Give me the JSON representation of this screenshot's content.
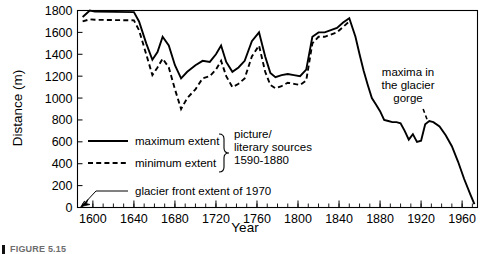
{
  "figure": {
    "caption_marker": "▌",
    "caption_text": "FIGURE 5.15"
  },
  "chart_data": {
    "type": "line",
    "title": "",
    "xlabel": "Year",
    "ylabel": "Distance (m)",
    "xlim": [
      1585,
      1975
    ],
    "ylim": [
      0,
      1800
    ],
    "grid": false,
    "legend_position": "inside-lower-left",
    "x_major_ticks": [
      1600,
      1640,
      1680,
      1720,
      1760,
      1800,
      1840,
      1880,
      1920,
      1960
    ],
    "x_tick_labels": [
      "1600",
      "1640",
      "1680",
      "1720",
      "1760",
      "1800",
      "1840",
      "1880",
      "1920",
      "1960"
    ],
    "x_minor_tick_step": 10,
    "y_major_ticks": [
      0,
      200,
      400,
      600,
      800,
      1000,
      1200,
      1400,
      1600,
      1800
    ],
    "y_tick_labels": [
      "0",
      "200",
      "400",
      "600",
      "800",
      "1000",
      "1200",
      "1400",
      "1600",
      "1800"
    ],
    "series": [
      {
        "name": "maximum extent",
        "style": "solid",
        "x": [
          1590,
          1597,
          1602,
          1640,
          1645,
          1652,
          1658,
          1663,
          1668,
          1674,
          1680,
          1686,
          1692,
          1700,
          1707,
          1714,
          1720,
          1725,
          1730,
          1736,
          1742,
          1748,
          1755,
          1762,
          1768,
          1773,
          1778,
          1784,
          1790,
          1796,
          1802,
          1808,
          1814,
          1820,
          1826,
          1832,
          1838,
          1844,
          1850,
          1856,
          1860,
          1864,
          1868,
          1872,
          1876,
          1880,
          1884,
          1888,
          1892,
          1896,
          1900,
          1904,
          1908,
          1912,
          1916,
          1920,
          1924,
          1928,
          1932,
          1938,
          1944,
          1950,
          1956,
          1962,
          1968,
          1972
        ],
        "y": [
          1740,
          1800,
          1790,
          1785,
          1700,
          1500,
          1350,
          1420,
          1560,
          1480,
          1300,
          1180,
          1240,
          1300,
          1340,
          1330,
          1400,
          1480,
          1330,
          1240,
          1280,
          1340,
          1520,
          1600,
          1380,
          1230,
          1190,
          1210,
          1220,
          1210,
          1200,
          1260,
          1560,
          1600,
          1600,
          1620,
          1640,
          1690,
          1730,
          1560,
          1400,
          1250,
          1120,
          1000,
          940,
          880,
          800,
          790,
          780,
          780,
          770,
          700,
          620,
          670,
          600,
          610,
          760,
          790,
          780,
          740,
          660,
          560,
          420,
          260,
          120,
          30
        ]
      },
      {
        "name": "minimum extent",
        "style": "dashed",
        "x": [
          1590,
          1597,
          1602,
          1640,
          1645,
          1652,
          1658,
          1663,
          1668,
          1674,
          1680,
          1686,
          1692,
          1700,
          1707,
          1714,
          1720,
          1725,
          1730,
          1736,
          1742,
          1748,
          1755,
          1762,
          1768,
          1773,
          1778,
          1784,
          1790,
          1796,
          1802,
          1808,
          1814,
          1820,
          1826,
          1832,
          1838,
          1844,
          1850
        ],
        "y": [
          1700,
          1720,
          1715,
          1710,
          1620,
          1400,
          1210,
          1280,
          1360,
          1280,
          1080,
          900,
          1000,
          1080,
          1180,
          1200,
          1260,
          1340,
          1200,
          1100,
          1130,
          1180,
          1380,
          1480,
          1240,
          1120,
          1090,
          1110,
          1140,
          1130,
          1120,
          1160,
          1500,
          1560,
          1560,
          1580,
          1600,
          1650,
          1700
        ]
      },
      {
        "name": "glacier front extent of 1970 marker",
        "style": "solid-thin",
        "x": [
          1588,
          1592
        ],
        "y": [
          0,
          60
        ]
      },
      {
        "name": "maxima in the glacier gorge",
        "style": "dashed-short",
        "x": [
          1922,
          1926
        ],
        "y": [
          900,
          800
        ]
      }
    ],
    "annotations": [
      {
        "name": "maxima-in-glacier-gorge",
        "lines": [
          "maxima in",
          "the glacier",
          "gorge"
        ],
        "x": 1918,
        "y": 1050
      }
    ]
  },
  "legend": {
    "entries": [
      {
        "label": "maximum extent",
        "style": "solid"
      },
      {
        "label": "minimum extent",
        "style": "dashed"
      }
    ],
    "brace_note_lines": [
      "picture/",
      "literary sources",
      "1590-1880"
    ],
    "extra_entry": {
      "label": "glacier front extent of 1970",
      "style": "solid-thin"
    }
  }
}
